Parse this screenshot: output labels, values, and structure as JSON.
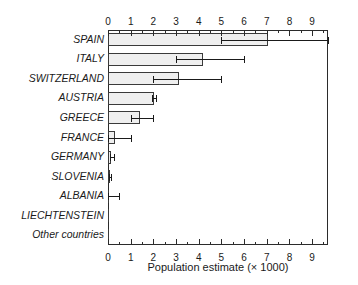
{
  "chart_data": {
    "type": "bar",
    "orientation": "horizontal",
    "title": "",
    "xlabel": "Population estimate (× 1000)",
    "ylabel": "",
    "xlim": [
      0,
      9.7
    ],
    "xticks": [
      0,
      1,
      2,
      3,
      4,
      5,
      6,
      7,
      8,
      9
    ],
    "xticklabels": [
      "0",
      "1",
      "2",
      "3",
      "4",
      "5",
      "6",
      "7",
      "8",
      "9"
    ],
    "minor_tick_interval": 0.5,
    "grid": false,
    "legend": null,
    "axis_positions": [
      "top",
      "bottom"
    ],
    "categories": [
      "SPAIN",
      "ITALY",
      "SWITZERLAND",
      "AUSTRIA",
      "GREECE",
      "FRANCE",
      "GERMANY",
      "SLOVENIA",
      "ALBANIA",
      "LIECHTENSTEIN",
      "Other countries"
    ],
    "values": [
      7.05,
      4.2,
      3.15,
      2.05,
      1.4,
      0.3,
      0.15,
      0.1,
      0.0,
      0.0,
      0.0
    ],
    "error_low": [
      5.0,
      3.0,
      2.0,
      1.95,
      1.0,
      0.0,
      0.08,
      0.05,
      0.0,
      0.0,
      0.0
    ],
    "error_high": [
      9.7,
      6.0,
      5.0,
      2.1,
      2.0,
      1.0,
      0.25,
      0.15,
      0.5,
      0.0,
      0.0
    ],
    "bar_fill_color": "#efefef",
    "bar_edge_color": "#3a3a3a",
    "error_bar_color": "#1a1a1a",
    "frame_color": "#2b2b2b",
    "background_color": "#ffffff"
  },
  "figure": {
    "xaxis_title": "Population estimate (× 1000)"
  }
}
